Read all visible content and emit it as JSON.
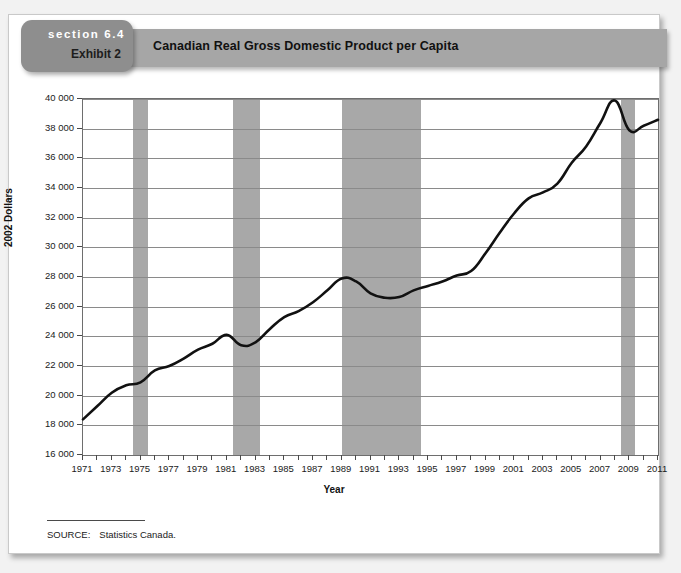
{
  "banner": {
    "section_label": "section 6.4",
    "exhibit_label": "Exhibit 2",
    "title": "Canadian Real Gross Domestic Product per Capita"
  },
  "source": {
    "label": "SOURCE:",
    "text": "Statistics Canada."
  },
  "colors": {
    "banner": "#a6a6a6",
    "tab": "#8e8e8e",
    "recession_band": "#a8a8a8",
    "line": "#111111",
    "gridline": "#8a8a8a",
    "plot_border": "#6e6e6e"
  },
  "chart_data": {
    "type": "line",
    "title": "Canadian Real Gross Domestic Product per Capita",
    "xlabel": "Year",
    "ylabel": "2002 Dollars",
    "xlim": [
      1971,
      2011
    ],
    "ylim": [
      16000,
      40000
    ],
    "ytick_step": 2000,
    "xtick_step": 2,
    "grid": true,
    "legend": "none",
    "ytick_labels": [
      "16 000",
      "18 000",
      "20 000",
      "22 000",
      "24 000",
      "26 000",
      "28 000",
      "30 000",
      "32 000",
      "34 000",
      "36 000",
      "38 000",
      "40 000"
    ],
    "ytick_values": [
      16000,
      18000,
      20000,
      22000,
      24000,
      26000,
      28000,
      30000,
      32000,
      34000,
      36000,
      38000,
      40000
    ],
    "xtick_labels": [
      "1971",
      "1973",
      "1975",
      "1977",
      "1979",
      "1981",
      "1983",
      "1985",
      "1987",
      "1989",
      "1991",
      "1993",
      "1995",
      "1997",
      "1999",
      "2001",
      "2003",
      "2005",
      "2007",
      "2009",
      "2011"
    ],
    "xtick_values": [
      1971,
      1973,
      1975,
      1977,
      1979,
      1981,
      1983,
      1985,
      1987,
      1989,
      1991,
      1993,
      1995,
      1997,
      1999,
      2001,
      2003,
      2005,
      2007,
      2009,
      2011
    ],
    "minor_xticks_every": 1,
    "series": [
      {
        "name": "Real GDP per capita (2002 dollars)",
        "x": [
          1971,
          1972,
          1973,
          1974,
          1975,
          1976,
          1977,
          1978,
          1979,
          1980,
          1981,
          1982,
          1983,
          1984,
          1985,
          1986,
          1987,
          1988,
          1989,
          1990,
          1991,
          1992,
          1993,
          1994,
          1995,
          1996,
          1997,
          1998,
          1999,
          2000,
          2001,
          2002,
          2003,
          2004,
          2005,
          2006,
          2007,
          2008,
          2009,
          2010,
          2011
        ],
        "values": [
          18400,
          19300,
          20200,
          20700,
          20900,
          21700,
          22000,
          22500,
          23100,
          23500,
          24100,
          23400,
          23600,
          24500,
          25300,
          25700,
          26300,
          27100,
          27900,
          27700,
          26900,
          26600,
          26650,
          27100,
          27400,
          27700,
          28100,
          28400,
          29600,
          31000,
          32300,
          33300,
          33700,
          34300,
          35700,
          36800,
          38400,
          39900,
          37900,
          38200,
          38600
        ]
      }
    ],
    "recession_bands": [
      {
        "start": 1974.5,
        "end": 1975.5
      },
      {
        "start": 1981.4,
        "end": 1983.3
      },
      {
        "start": 1989.0,
        "end": 1994.5
      },
      {
        "start": 2008.4,
        "end": 2009.4
      }
    ]
  }
}
